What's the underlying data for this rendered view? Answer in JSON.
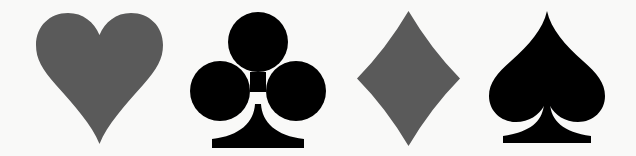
{
  "background": "#f9f9f8",
  "suits": [
    {
      "name": "heart",
      "color": "#5a5a5a"
    },
    {
      "name": "club",
      "color": "#000000"
    },
    {
      "name": "diamond",
      "color": "#5a5a5a"
    },
    {
      "name": "spade",
      "color": "#000000"
    }
  ]
}
